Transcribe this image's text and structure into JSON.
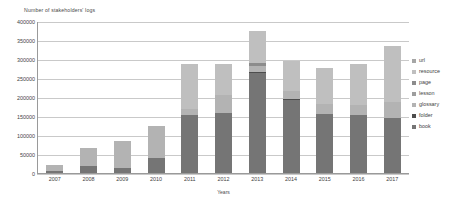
{
  "chart": {
    "type": "bar",
    "y_axis_title": "Number of stakeholders' logs",
    "x_axis_title": "Years"
  },
  "axis": {
    "yticks": [
      "400000",
      "350000",
      "300000",
      "250000",
      "200000",
      "150000",
      "100000",
      "50000",
      "0"
    ]
  },
  "legend": {
    "items": [
      {
        "label": "url",
        "color": "#a6a6a6"
      },
      {
        "label": "resource",
        "color": "#bfbfbf"
      },
      {
        "label": "page",
        "color": "#8c8c8c"
      },
      {
        "label": "lesson",
        "color": "#9e9e9e"
      },
      {
        "label": "glossary",
        "color": "#b3b3b3"
      },
      {
        "label": "folder",
        "color": "#4d4d4d"
      },
      {
        "label": "book",
        "color": "#757575"
      }
    ]
  },
  "chart_data": {
    "type": "bar",
    "subtype": "stacked-vertical",
    "title": "",
    "subtitle": "",
    "xlabel": "Years",
    "ylabel": "Number of stakeholders' logs",
    "ylim": [
      0,
      400000
    ],
    "ytick_step": 50000,
    "grid": true,
    "legend_position": "right",
    "categories": [
      "2007",
      "2008",
      "2009",
      "2010",
      "2011",
      "2012",
      "2013",
      "2014",
      "2015",
      "2016",
      "2017"
    ],
    "stack_order_bottom_to_top": [
      "book",
      "folder",
      "glossary",
      "lesson",
      "page",
      "resource",
      "url"
    ],
    "series": [
      {
        "name": "book",
        "color": "#757575",
        "values": [
          4000,
          19000,
          14000,
          39000,
          153000,
          157000,
          262000,
          192000,
          156000,
          153000,
          144000
        ]
      },
      {
        "name": "folder",
        "color": "#4d4d4d",
        "values": [
          0,
          0,
          0,
          0,
          0,
          0,
          5000,
          3000,
          0,
          0,
          0
        ]
      },
      {
        "name": "glossary",
        "color": "#b3b3b3",
        "values": [
          17000,
          48000,
          71000,
          84000,
          16000,
          48000,
          14000,
          21000,
          25000,
          27000,
          44000
        ]
      },
      {
        "name": "lesson",
        "color": "#9e9e9e",
        "values": [
          0,
          0,
          0,
          0,
          0,
          0,
          0,
          0,
          0,
          0,
          0
        ]
      },
      {
        "name": "page",
        "color": "#8c8c8c",
        "values": [
          0,
          0,
          0,
          0,
          0,
          0,
          8000,
          0,
          0,
          0,
          0
        ]
      },
      {
        "name": "resource",
        "color": "#bfbfbf",
        "values": [
          0,
          0,
          0,
          0,
          119000,
          81000,
          84000,
          79000,
          95000,
          108000,
          145000
        ]
      },
      {
        "name": "url",
        "color": "#a6a6a6",
        "values": [
          0,
          0,
          0,
          0,
          0,
          0,
          0,
          0,
          0,
          0,
          0
        ]
      }
    ],
    "totals": [
      21000,
      67000,
      85000,
      123000,
      288000,
      286000,
      373000,
      295000,
      276000,
      288000,
      333000
    ]
  }
}
